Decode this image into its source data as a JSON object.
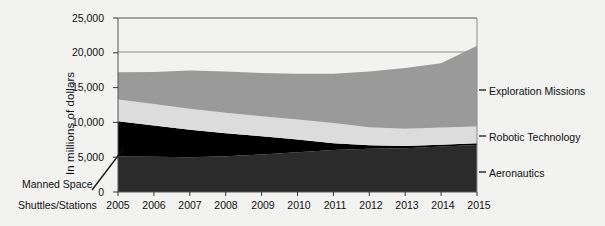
{
  "chart_data": {
    "type": "area",
    "title": "",
    "xlabel": "",
    "ylabel": "In millions of dollars",
    "categories": [
      2005,
      2006,
      2007,
      2008,
      2009,
      2010,
      2011,
      2012,
      2013,
      2014,
      2015
    ],
    "x": [
      2005,
      2006,
      2007,
      2008,
      2009,
      2010,
      2011,
      2012,
      2013,
      2014,
      2015
    ],
    "xlim": [
      2005,
      2015
    ],
    "ylim": [
      0,
      25000
    ],
    "yticks": [
      0,
      5000,
      10000,
      15000,
      20000,
      25000
    ],
    "ytick_labels": [
      "0",
      "5,000",
      "10,000",
      "15,000",
      "20,000",
      "25,000"
    ],
    "xtick_labels": [
      "2005",
      "2006",
      "2007",
      "2008",
      "2009",
      "2010",
      "2011",
      "2012",
      "2013",
      "2014",
      "2015"
    ],
    "grid": true,
    "stacked": true,
    "legend_position": "right-inline-labels",
    "series": [
      {
        "name": "Aeronautics",
        "color": "#2b2b2b",
        "values": [
          5100,
          5050,
          5000,
          5150,
          5400,
          5700,
          6050,
          6200,
          6300,
          6550,
          6750
        ]
      },
      {
        "name": "Manned Space Shuttles/Stations",
        "color": "#000000",
        "values": [
          5050,
          4500,
          3950,
          3300,
          2600,
          1850,
          950,
          500,
          300,
          250,
          250
        ]
      },
      {
        "name": "Robotic Technology",
        "color": "#dcdcdc",
        "values": [
          3150,
          3100,
          3000,
          2950,
          2900,
          2850,
          2900,
          2600,
          2500,
          2450,
          2400
        ]
      },
      {
        "name": "Exploration Missions",
        "color": "#9a9a9a",
        "values": [
          3900,
          4600,
          5500,
          5900,
          6200,
          6600,
          7100,
          8000,
          8700,
          9250,
          11600
        ]
      }
    ],
    "cumulative_tops": {
      "Aeronautics": [
        5100,
        5050,
        5000,
        5150,
        5400,
        5700,
        6050,
        6200,
        6300,
        6550,
        6750
      ],
      "MannedSpace": [
        10150,
        9550,
        8950,
        8450,
        8000,
        7550,
        7000,
        6700,
        6600,
        6800,
        7000
      ],
      "RoboticTechnology": [
        13300,
        12650,
        11950,
        11400,
        10900,
        10400,
        9900,
        9300,
        9100,
        9250,
        9400
      ],
      "ExplorationMissions": [
        17200,
        17250,
        17450,
        17300,
        17100,
        17000,
        17000,
        17300,
        17800,
        18500,
        21000
      ]
    },
    "annotations": [
      {
        "name": "manned-space-callout",
        "text_line1": "Manned Space",
        "text_line2": "Shuttles/Stations",
        "points_to_series": "Manned Space Shuttles/Stations"
      }
    ],
    "inline_labels": [
      {
        "name": "Exploration Missions"
      },
      {
        "name": "Robotic Technology"
      },
      {
        "name": "Aeronautics"
      }
    ]
  },
  "axis": {
    "ylabel": "In millions of dollars"
  },
  "callout": {
    "line1": "Manned Space",
    "line2": "Shuttles/Stations"
  },
  "right_labels": {
    "exploration": "Exploration Missions",
    "robotic": "Robotic Technology",
    "aeronautics": "Aeronautics"
  },
  "yticks": {
    "t0": "0",
    "t1": "5,000",
    "t2": "10,000",
    "t3": "15,000",
    "t4": "20,000",
    "t5": "25,000"
  },
  "xticks": {
    "x0": "2005",
    "x1": "2006",
    "x2": "2007",
    "x3": "2008",
    "x4": "2009",
    "x5": "2010",
    "x6": "2011",
    "x7": "2012",
    "x8": "2013",
    "x9": "2014",
    "x10": "2015"
  },
  "colors": {
    "aeronautics": "#2b2b2b",
    "manned_space": "#000000",
    "robotic": "#dcdcdc",
    "exploration": "#9a9a9a",
    "background": "#f2f2f0",
    "axis": "#555555"
  }
}
